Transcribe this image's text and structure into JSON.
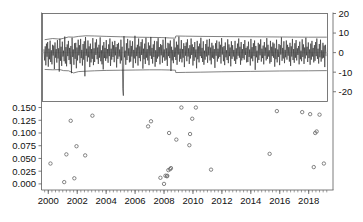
{
  "chart_data": {
    "type": "scatter",
    "title": "",
    "subtitle": "",
    "xlabel": "",
    "ylabel": "",
    "grid": false,
    "legend": "none",
    "panels": [
      {
        "name": "residual-series-panel",
        "axis": "right",
        "ylabel": "",
        "ylim": [
          -25,
          20
        ],
        "yticks": [
          20,
          10,
          0,
          -10,
          -20
        ],
        "ytick_labels": [
          "20",
          "10",
          "0",
          "-10",
          "-20"
        ],
        "series": [
          {
            "name": "residuals",
            "type": "line",
            "values": [
              1.5,
              -4.0,
              3.2,
              -6.5,
              4.6,
              -2.1,
              5.4,
              -7.2,
              2.0,
              -3.4,
              6.1,
              -4.8,
              1.2,
              -6.0,
              4.0,
              -1.5,
              3.6,
              -8.4,
              5.2,
              -2.6,
              1.8,
              -5.1,
              6.4,
              -3.0,
              2.2,
              -9.7,
              7.1,
              -4.2,
              3.0,
              -6.8,
              5.6,
              -2.0,
              1.0,
              -4.4,
              8.2,
              -5.6,
              2.8,
              -7.0,
              4.2,
              -1.8,
              6.0,
              -3.8,
              2.4,
              -5.9,
              3.4,
              -10.5,
              7.6,
              -2.2,
              1.6,
              -6.2,
              4.8,
              -3.2,
              5.0,
              -8.0,
              2.6,
              -4.0,
              6.6,
              -1.4,
              3.8,
              -5.4,
              7.0,
              -2.8,
              1.4,
              -6.6,
              4.4,
              -3.6,
              5.8,
              -12.1,
              8.0,
              -1.6,
              2.0,
              -4.6,
              6.2,
              -2.4,
              3.2,
              -7.4,
              4.6,
              -5.0,
              1.8,
              -3.2,
              7.4,
              -6.4,
              2.2,
              -4.8,
              5.2,
              -1.2,
              6.8,
              -3.4,
              2.6,
              -5.8,
              4.0,
              -2.6,
              7.8,
              -4.4,
              1.2,
              -6.0,
              3.6,
              -8.6,
              5.4,
              -2.8,
              2.4,
              -4.2,
              6.4,
              -3.0,
              1.8,
              -5.2,
              4.2,
              -1.8,
              7.2,
              -6.8,
              2.0,
              -3.6,
              5.6,
              -2.2,
              3.8,
              -4.9,
              6.0,
              -1.4,
              2.8,
              -7.6,
              4.4,
              -3.2,
              5.0,
              -2.0,
              1.6,
              -5.6,
              6.6,
              -4.0,
              3.0,
              -18.5,
              -22.0,
              8.4,
              -2.4,
              1.0,
              -6.2,
              4.8,
              -3.8,
              7.0,
              -1.6,
              2.2,
              -5.0,
              6.2,
              -4.6,
              3.4,
              -2.0,
              5.8,
              -7.8,
              1.4,
              -3.0,
              8.6,
              -5.4,
              2.6,
              -1.8,
              4.0,
              -6.6,
              7.2,
              -2.8,
              3.2,
              -4.4,
              5.4,
              -1.2,
              6.8,
              -8.2,
              2.0,
              -3.4,
              4.6,
              -5.8,
              7.6,
              -2.6,
              1.8,
              -4.0,
              5.2,
              -6.4,
              3.6,
              -1.6,
              8.0,
              -3.2,
              2.4,
              -5.6,
              4.2,
              -2.2,
              6.0,
              -7.2,
              1.2,
              -4.8,
              5.8,
              -3.0,
              7.4,
              -2.0,
              2.8,
              -6.0,
              4.4,
              -1.4,
              3.8,
              -5.2,
              6.6,
              -2.4,
              1.6,
              -4.2,
              7.8,
              -3.6,
              2.2,
              -6.8,
              5.0,
              -1.8,
              4.6,
              -2.8,
              6.2,
              -9.4,
              3.0,
              -4.0,
              1.4,
              -5.4,
              7.0,
              -2.2,
              2.6,
              -3.8,
              5.6,
              -6.2,
              4.0,
              -1.0,
              8.2,
              -4.6,
              2.0,
              -3.2,
              6.4,
              -5.0,
              1.8,
              -2.6,
              4.8,
              -7.4,
              3.4,
              -1.6,
              5.2,
              -4.4,
              6.8,
              -2.0,
              2.2,
              -5.8,
              3.8,
              -3.0,
              7.2,
              -1.2,
              4.2,
              -6.6,
              2.8,
              -4.2,
              5.4,
              -2.4,
              1.6,
              -8.0,
              6.0,
              -3.4,
              3.2,
              -5.0,
              4.6,
              -1.8,
              7.6,
              -2.8,
              2.4,
              -4.8,
              5.8,
              -6.2,
              1.0,
              -3.6,
              4.4,
              -2.0,
              6.6,
              -5.2,
              3.0,
              -1.4,
              7.0,
              -4.0,
              2.6,
              -6.0,
              5.0,
              -2.6,
              3.6,
              -3.2,
              1.8,
              -7.8,
              4.8,
              -1.6,
              6.2,
              -4.6,
              2.0,
              -3.0,
              5.6,
              -2.2,
              4.0,
              -5.6,
              7.4,
              -1.0,
              2.8,
              -4.4,
              3.4,
              -6.4,
              5.2,
              -2.4,
              1.2,
              -3.8,
              6.8,
              -5.4,
              4.2,
              -1.8,
              2.6,
              -7.0,
              5.8,
              -3.2,
              3.8,
              -2.0,
              1.4,
              -4.2,
              6.0,
              -5.8,
              2.2,
              -3.4,
              4.6,
              -1.6,
              7.2,
              -2.6,
              3.0,
              -6.2,
              5.4,
              -4.0,
              1.8,
              -2.8,
              4.4,
              -3.6,
              6.4,
              -1.2,
              2.4,
              -5.0,
              3.2,
              -4.8,
              5.6,
              -2.2,
              1.6,
              -6.6,
              7.0,
              -3.0,
              2.8,
              -4.4,
              4.8,
              -1.8,
              6.2,
              -8.8,
              3.4,
              -2.4,
              1.0,
              -5.2,
              5.0,
              -3.8,
              4.2,
              -1.4,
              6.8,
              -4.6,
              2.0,
              -2.8,
              3.6,
              -6.0,
              5.4,
              -1.6,
              2.6,
              -4.0,
              7.4,
              -3.2,
              4.0,
              -2.0,
              1.2,
              -5.6,
              6.0,
              -4.8,
              3.0,
              -1.8,
              5.2,
              -2.6,
              4.6,
              -7.2,
              2.2,
              -3.4,
              6.6,
              -5.0,
              1.6,
              -2.2,
              4.4,
              -6.4,
              3.8,
              -1.0,
              7.8,
              -4.2,
              2.4,
              -3.0,
              5.8,
              -5.4,
              1.4,
              -2.4,
              6.2,
              -3.6,
              4.0,
              -1.6,
              2.8,
              -4.6,
              5.0,
              -6.8,
              3.2,
              -2.0,
              7.0,
              -3.8,
              1.8,
              -5.2,
              4.8,
              -2.6,
              6.4,
              -4.0,
              2.2,
              -1.2,
              3.4,
              -6.0,
              5.6,
              -3.4,
              1.0,
              -4.4,
              6.8,
              -2.2,
              4.2,
              -5.8,
              2.6,
              -3.0,
              7.6,
              -1.4,
              3.0,
              -4.8,
              5.2,
              -2.8,
              1.6,
              -6.2,
              4.6,
              -3.6,
              6.0,
              -2.0,
              2.4,
              -5.0,
              3.8,
              -4.2,
              5.4,
              -1.8,
              7.2,
              -3.2,
              2.0,
              -5.6,
              4.4,
              -2.4,
              6.6,
              -4.6,
              1.2,
              -3.0,
              5.0,
              -2.6,
              3.6,
              -7.4,
              4.0,
              -1.6
            ]
          },
          {
            "name": "upper-band",
            "type": "line",
            "note": "upper confidence bound, roughly +7 rising to +8, with level shift near 2008.8"
          },
          {
            "name": "lower-band",
            "type": "line",
            "note": "lower confidence bound, roughly -9 narrowing to -7, with level shift near 2008.8"
          }
        ]
      },
      {
        "name": "pvalue-scatter-panel",
        "axis": "left",
        "ylabel": "",
        "ylim": [
          0.155,
          -0.012
        ],
        "yticks": [
          0.0,
          0.025,
          0.05,
          0.075,
          0.1,
          0.125,
          0.15
        ],
        "ytick_labels": [
          "0.000",
          "0.025",
          "0.050",
          "0.075",
          "0.100",
          "0.125",
          "0.150"
        ],
        "inverted_y": true,
        "points": [
          {
            "x": 2000.15,
            "y": 0.04
          },
          {
            "x": 2001.1,
            "y": 0.0035
          },
          {
            "x": 2001.25,
            "y": 0.058
          },
          {
            "x": 2001.55,
            "y": 0.124
          },
          {
            "x": 2001.8,
            "y": 0.011
          },
          {
            "x": 2001.95,
            "y": 0.074
          },
          {
            "x": 2002.55,
            "y": 0.056
          },
          {
            "x": 2003.05,
            "y": 0.134
          },
          {
            "x": 2006.9,
            "y": 0.113
          },
          {
            "x": 2007.1,
            "y": 0.123
          },
          {
            "x": 2007.75,
            "y": 0.012
          },
          {
            "x": 2008.0,
            "y": 0.0
          },
          {
            "x": 2008.1,
            "y": 0.016
          },
          {
            "x": 2008.2,
            "y": 0.015
          },
          {
            "x": 2008.22,
            "y": 0.016
          },
          {
            "x": 2008.3,
            "y": 0.027
          },
          {
            "x": 2008.42,
            "y": 0.029
          },
          {
            "x": 2008.48,
            "y": 0.031
          },
          {
            "x": 2008.35,
            "y": 0.1
          },
          {
            "x": 2008.85,
            "y": 0.087
          },
          {
            "x": 2009.2,
            "y": 0.15
          },
          {
            "x": 2009.75,
            "y": 0.076
          },
          {
            "x": 2009.8,
            "y": 0.098
          },
          {
            "x": 2009.95,
            "y": 0.128
          },
          {
            "x": 2010.2,
            "y": 0.15
          },
          {
            "x": 2011.25,
            "y": 0.028
          },
          {
            "x": 2015.3,
            "y": 0.059
          },
          {
            "x": 2015.8,
            "y": 0.143
          },
          {
            "x": 2017.55,
            "y": 0.141
          },
          {
            "x": 2018.1,
            "y": 0.137
          },
          {
            "x": 2018.35,
            "y": 0.033
          },
          {
            "x": 2018.45,
            "y": 0.1
          },
          {
            "x": 2018.55,
            "y": 0.103
          },
          {
            "x": 2018.75,
            "y": 0.136
          },
          {
            "x": 2019.05,
            "y": 0.04
          }
        ]
      }
    ],
    "x": {
      "xlim": [
        1999.6,
        2019.3
      ],
      "xticks": [
        2000,
        2002,
        2004,
        2006,
        2008,
        2010,
        2012,
        2014,
        2016,
        2018
      ],
      "xtick_labels": [
        "2000",
        "2002",
        "2004",
        "2006",
        "2008",
        "2010",
        "2012",
        "2014",
        "2016",
        "2018"
      ],
      "minor_tick_interval": 0.25
    }
  }
}
